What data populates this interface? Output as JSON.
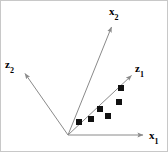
{
  "figure": {
    "kind": "vector-axes-scatter-diagram",
    "background_color": "#ffffff",
    "border_color": "#c8c8c8",
    "line_color": "#808080",
    "marker_color": "#000000",
    "text_color": "#000000"
  },
  "chart_data": {
    "type": "scatter",
    "title": "",
    "subtitle": "",
    "xlabel": "",
    "ylabel": "",
    "grid": false,
    "legend": "none",
    "origin_px": [
      67,
      134
    ],
    "axes": [
      {
        "name": "x1-axis",
        "label": "x",
        "subscript": "1",
        "label_text": "x₁",
        "from_px": [
          67,
          134
        ],
        "to_px": [
          145,
          134
        ],
        "arrow": true,
        "label_px": [
          148,
          129
        ]
      },
      {
        "name": "x2-axis",
        "label": "x",
        "subscript": "2",
        "label_text": "x₂",
        "from_px": [
          67,
          134
        ],
        "to_px": [
          112,
          23
        ],
        "arrow": true,
        "label_px": [
          108,
          5
        ]
      },
      {
        "name": "z1-axis",
        "label": "z",
        "subscript": "1",
        "label_text": "z₁",
        "from_px": [
          67,
          134
        ],
        "to_px": [
          133,
          72
        ],
        "arrow": true,
        "label_px": [
          134,
          62
        ]
      },
      {
        "name": "z2-axis",
        "label": "z",
        "subscript": "2",
        "label_text": "z₂",
        "from_px": [
          67,
          134
        ],
        "to_px": [
          22,
          70
        ],
        "arrow": true,
        "label_px": [
          4,
          58
        ]
      }
    ],
    "points_px": [
      [
        78,
        121
      ],
      [
        90,
        118
      ],
      [
        99,
        108
      ],
      [
        107,
        115
      ],
      [
        118,
        101
      ],
      [
        120,
        87
      ]
    ],
    "marker": {
      "shape": "square",
      "size_px": 6,
      "fill": "#111111"
    },
    "n_points": 6
  }
}
